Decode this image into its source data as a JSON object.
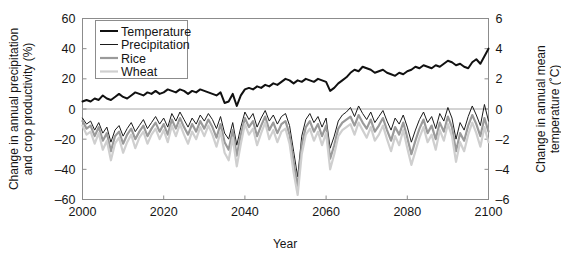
{
  "chart_data": {
    "type": "line",
    "title": "",
    "xlabel": "Year",
    "ylabel": "Change in annual precipitation and crop productivity (%)",
    "ylabel_line1": "Change in annual precipitation",
    "ylabel_line2": "and crop productivity (%)",
    "y2label": "Change in annual mean temperature (˚C)",
    "y2label_line1": "Change in annual mean",
    "y2label_line2": "temperature (˚C)",
    "xlim": [
      2000,
      2100
    ],
    "ylim": [
      -60,
      60
    ],
    "y2lim": [
      -6,
      6
    ],
    "xticks": [
      2000,
      2020,
      2040,
      2060,
      2080,
      2100
    ],
    "xtick_labels": [
      "2000",
      "2020",
      "2040",
      "2060",
      "2080",
      "2100"
    ],
    "yticks": [
      60,
      40,
      20,
      0,
      -20,
      -40,
      -60
    ],
    "ytick_labels": [
      "60",
      "40",
      "20",
      "0",
      "–20",
      "–40",
      "–60"
    ],
    "y2ticks": [
      6,
      4,
      2,
      0,
      -2,
      -4,
      -6
    ],
    "y2tick_labels": [
      "6",
      "4",
      "2",
      "0",
      "–2",
      "–4",
      "–6"
    ],
    "grid": false,
    "zero_line": true,
    "legend_position": "top-left",
    "legend_entries": [
      "Temperature",
      "Precipitation",
      "Rice",
      "Wheat"
    ],
    "colors": {
      "temperature": "#111111",
      "precipitation": "#1a1a1a",
      "rice": "#9a9a9a",
      "wheat": "#cfcfcf",
      "axis": "#8c8c8c",
      "zero_line": "#a8a8a8",
      "background": "#ffffff"
    },
    "x": [
      2000,
      2001,
      2002,
      2003,
      2004,
      2005,
      2006,
      2007,
      2008,
      2009,
      2010,
      2011,
      2012,
      2013,
      2014,
      2015,
      2016,
      2017,
      2018,
      2019,
      2020,
      2021,
      2022,
      2023,
      2024,
      2025,
      2026,
      2027,
      2028,
      2029,
      2030,
      2031,
      2032,
      2033,
      2034,
      2035,
      2036,
      2037,
      2038,
      2039,
      2040,
      2041,
      2042,
      2043,
      2044,
      2045,
      2046,
      2047,
      2048,
      2049,
      2050,
      2051,
      2052,
      2053,
      2054,
      2055,
      2056,
      2057,
      2058,
      2059,
      2060,
      2061,
      2062,
      2063,
      2064,
      2065,
      2066,
      2067,
      2068,
      2069,
      2070,
      2071,
      2072,
      2073,
      2074,
      2075,
      2076,
      2077,
      2078,
      2079,
      2080,
      2081,
      2082,
      2083,
      2084,
      2085,
      2086,
      2087,
      2088,
      2089,
      2090,
      2091,
      2092,
      2093,
      2094,
      2095,
      2096,
      2097,
      2098,
      2099,
      2100
    ],
    "series": [
      {
        "name": "Temperature",
        "axis": "right",
        "unit": "˚C",
        "color": "#111111",
        "linewidth": 2.0,
        "values_percent_scale": [
          5,
          6,
          5,
          7,
          6,
          9,
          7,
          6,
          8,
          10,
          8,
          7,
          9,
          11,
          10,
          9,
          11,
          10,
          12,
          10,
          11,
          13,
          12,
          11,
          13,
          12,
          10,
          12,
          11,
          13,
          12,
          11,
          10,
          9,
          11,
          4,
          5,
          10,
          2,
          9,
          13,
          14,
          13,
          15,
          14,
          16,
          15,
          17,
          16,
          18,
          20,
          19,
          17,
          19,
          18,
          20,
          19,
          18,
          20,
          19,
          18,
          12,
          14,
          17,
          19,
          21,
          24,
          26,
          25,
          28,
          27,
          26,
          24,
          25,
          26,
          24,
          23,
          22,
          24,
          23,
          25,
          26,
          28,
          27,
          29,
          28,
          27,
          29,
          28,
          30,
          32,
          31,
          29,
          30,
          28,
          27,
          31,
          33,
          30,
          35,
          40
        ],
        "values_celsius": [
          0.5,
          0.6,
          0.5,
          0.7,
          0.6,
          0.9,
          0.7,
          0.6,
          0.8,
          1.0,
          0.8,
          0.7,
          0.9,
          1.1,
          1.0,
          0.9,
          1.1,
          1.0,
          1.2,
          1.0,
          1.1,
          1.3,
          1.2,
          1.1,
          1.3,
          1.2,
          1.0,
          1.2,
          1.1,
          1.3,
          1.2,
          1.1,
          1.0,
          0.9,
          1.1,
          0.4,
          0.5,
          1.0,
          0.2,
          0.9,
          1.3,
          1.4,
          1.3,
          1.5,
          1.4,
          1.6,
          1.5,
          1.7,
          1.6,
          1.8,
          2.0,
          1.9,
          1.7,
          1.9,
          1.8,
          2.0,
          1.9,
          1.8,
          2.0,
          1.9,
          1.8,
          1.2,
          1.4,
          1.7,
          1.9,
          2.1,
          2.4,
          2.6,
          2.5,
          2.8,
          2.7,
          2.6,
          2.4,
          2.5,
          2.6,
          2.4,
          2.3,
          2.2,
          2.4,
          2.3,
          2.5,
          2.6,
          2.8,
          2.7,
          2.9,
          2.8,
          2.7,
          2.9,
          2.8,
          3.0,
          3.2,
          3.1,
          2.9,
          3.0,
          2.8,
          2.7,
          3.1,
          3.3,
          3.0,
          3.5,
          4.0
        ]
      },
      {
        "name": "Precipitation",
        "axis": "left",
        "unit": "%",
        "color": "#1a1a1a",
        "linewidth": 1.0,
        "values": [
          -6,
          -10,
          -8,
          -14,
          -9,
          -16,
          -12,
          -22,
          -14,
          -11,
          -18,
          -13,
          -9,
          -15,
          -11,
          -7,
          -13,
          -9,
          -5,
          -10,
          -6,
          -12,
          -3,
          -8,
          -2,
          -7,
          -12,
          -6,
          -10,
          -4,
          -8,
          -3,
          -7,
          -13,
          -5,
          -16,
          -20,
          -9,
          -24,
          -12,
          -2,
          -7,
          -3,
          -12,
          -6,
          -1,
          -8,
          -4,
          -10,
          -5,
          -3,
          -11,
          -28,
          -45,
          -18,
          -7,
          -3,
          -9,
          -5,
          -12,
          -6,
          -26,
          -18,
          -8,
          -4,
          -2,
          1,
          -5,
          2,
          -3,
          -7,
          -2,
          -9,
          -5,
          -1,
          -8,
          -14,
          -6,
          -10,
          -4,
          -12,
          -22,
          -14,
          -7,
          -2,
          -9,
          -5,
          -13,
          -3,
          -8,
          1,
          -6,
          -20,
          -9,
          -14,
          -5,
          2,
          -4,
          -11,
          3,
          -8
        ]
      },
      {
        "name": "Rice",
        "axis": "left",
        "unit": "%",
        "color": "#9a9a9a",
        "linewidth": 2.2,
        "values": [
          -8,
          -13,
          -11,
          -18,
          -12,
          -21,
          -16,
          -28,
          -18,
          -15,
          -23,
          -17,
          -13,
          -20,
          -15,
          -11,
          -18,
          -13,
          -9,
          -15,
          -10,
          -17,
          -7,
          -13,
          -6,
          -12,
          -17,
          -10,
          -15,
          -8,
          -13,
          -7,
          -12,
          -19,
          -10,
          -22,
          -27,
          -14,
          -31,
          -17,
          -6,
          -12,
          -8,
          -18,
          -11,
          -5,
          -14,
          -9,
          -16,
          -10,
          -8,
          -17,
          -35,
          -52,
          -24,
          -12,
          -8,
          -15,
          -10,
          -18,
          -11,
          -33,
          -24,
          -13,
          -9,
          -7,
          -5,
          -11,
          -4,
          -9,
          -13,
          -7,
          -15,
          -11,
          -6,
          -14,
          -21,
          -12,
          -17,
          -9,
          -19,
          -30,
          -21,
          -13,
          -7,
          -16,
          -11,
          -20,
          -9,
          -15,
          -5,
          -12,
          -28,
          -16,
          -21,
          -11,
          -4,
          -10,
          -18,
          -6,
          -15
        ]
      },
      {
        "name": "Wheat",
        "axis": "left",
        "unit": "%",
        "color": "#cfcfcf",
        "linewidth": 2.2,
        "values": [
          -11,
          -17,
          -15,
          -23,
          -16,
          -27,
          -21,
          -34,
          -23,
          -19,
          -29,
          -22,
          -17,
          -26,
          -19,
          -15,
          -23,
          -17,
          -13,
          -20,
          -14,
          -22,
          -11,
          -18,
          -10,
          -17,
          -23,
          -15,
          -20,
          -12,
          -18,
          -11,
          -17,
          -25,
          -15,
          -29,
          -34,
          -19,
          -38,
          -23,
          -10,
          -17,
          -13,
          -24,
          -16,
          -9,
          -20,
          -14,
          -22,
          -15,
          -13,
          -23,
          -42,
          -57,
          -30,
          -17,
          -13,
          -21,
          -15,
          -24,
          -16,
          -40,
          -30,
          -18,
          -14,
          -12,
          -10,
          -17,
          -9,
          -14,
          -19,
          -12,
          -21,
          -17,
          -11,
          -20,
          -28,
          -18,
          -24,
          -14,
          -26,
          -37,
          -28,
          -19,
          -12,
          -22,
          -17,
          -27,
          -14,
          -21,
          -10,
          -18,
          -35,
          -22,
          -28,
          -17,
          -9,
          -16,
          -25,
          -12,
          -22
        ]
      }
    ]
  }
}
